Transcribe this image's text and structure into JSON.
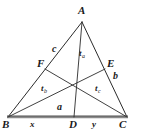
{
  "figure": {
    "stroke_color": "#2b2b2b",
    "base_color": "#777777",
    "background": "#ffffff"
  },
  "points": {
    "A": {
      "label": "A",
      "x": 82,
      "y": 22
    },
    "B": {
      "label": "B",
      "x": 8,
      "y": 117
    },
    "C": {
      "label": "C",
      "x": 127,
      "y": 117
    },
    "D": {
      "label": "D",
      "x": 74,
      "y": 117
    },
    "E": {
      "label": "E",
      "x": 105,
      "y": 69
    },
    "F": {
      "label": "F",
      "x": 45,
      "y": 69
    },
    "G": {
      "label": "",
      "x": 76,
      "y": 78
    }
  },
  "labels": {
    "vertex_a": "A",
    "vertex_b": "B",
    "vertex_c": "C",
    "point_d": "D",
    "point_e": "E",
    "point_f": "F",
    "side_a": "a",
    "side_b": "b",
    "side_c": "c",
    "segment_x": "x",
    "segment_y": "y",
    "median_a_base": "t",
    "median_a_sub": "a",
    "median_b_base": "t",
    "median_b_sub": "b",
    "median_c_base": "t",
    "median_c_sub": "c"
  }
}
